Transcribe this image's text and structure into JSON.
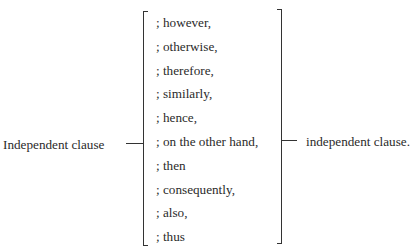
{
  "diagram": {
    "left_label": "Independent clause",
    "right_label": "independent clause.",
    "connectors": [
      "; however,",
      "; otherwise,",
      "; therefore,",
      "; similarly,",
      "; hence,",
      "; on the other hand,",
      "; then",
      "; consequently,",
      "; also,",
      "; thus"
    ]
  }
}
